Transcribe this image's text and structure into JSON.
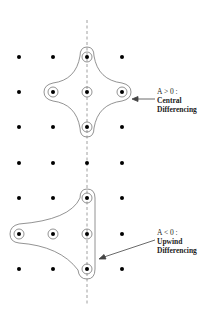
{
  "diagram": {
    "grid": {
      "columns_x": [
        19,
        53,
        87,
        122
      ],
      "rows_y": [
        57,
        92,
        127,
        163,
        198,
        234,
        269
      ],
      "dot_color": "#000000"
    },
    "axis_line": {
      "x": 87,
      "y1": 20,
      "y2": 305,
      "style": "dashed"
    },
    "stencils": [
      {
        "name": "central",
        "condition": "A > 0 :",
        "label_line1": "Central",
        "label_line2": "Differencing",
        "circled_points": [
          [
            87,
            57
          ],
          [
            53,
            92
          ],
          [
            87,
            92
          ],
          [
            122,
            92
          ],
          [
            87,
            127
          ]
        ]
      },
      {
        "name": "upwind",
        "condition": "A < 0 :",
        "label_line1": "Upwind",
        "label_line2": "Differencing",
        "circled_points": [
          [
            87,
            198
          ],
          [
            19,
            234
          ],
          [
            53,
            234
          ],
          [
            87,
            234
          ],
          [
            87,
            269
          ]
        ]
      }
    ]
  }
}
